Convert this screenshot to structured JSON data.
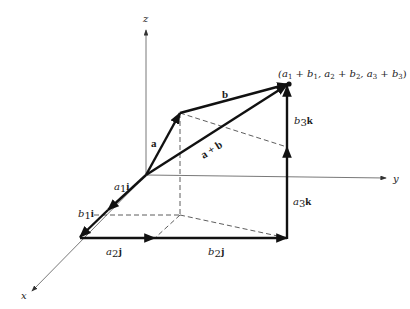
{
  "diagram": {
    "axes": {
      "x_label": "x",
      "y_label": "y",
      "z_label": "z"
    },
    "vectors": {
      "a": "a",
      "b": "b",
      "sum": "a + b"
    },
    "components": {
      "a1i": {
        "coef": "a",
        "sub": "1",
        "unit": "i"
      },
      "b1i": {
        "coef": "b",
        "sub": "1",
        "unit": "i"
      },
      "a2j": {
        "coef": "a",
        "sub": "2",
        "unit": "j"
      },
      "b2j": {
        "coef": "b",
        "sub": "2",
        "unit": "j"
      },
      "a3k": {
        "coef": "a",
        "sub": "3",
        "unit": "k"
      },
      "b3k": {
        "coef": "b",
        "sub": "3",
        "unit": "k"
      }
    },
    "endpoint_label": "(a1 + b1, a2 + b2, a3 + b3)",
    "endpoint_parts": {
      "p1": "(a",
      "s1": "1",
      "p2": " + b",
      "s2": "1",
      "p3": ", a",
      "s3": "2",
      "p4": " + b",
      "s4": "2",
      "p5": ", a",
      "s5": "3",
      "p6": " + b",
      "s6": "3",
      "p7": ")"
    },
    "colors": {
      "vector": "#111111",
      "axis": "#555555",
      "background": "#ffffff"
    }
  }
}
